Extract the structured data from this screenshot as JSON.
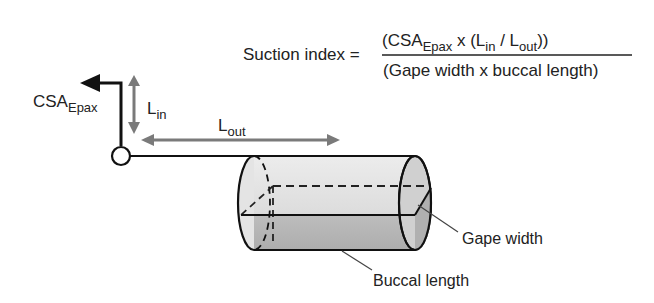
{
  "formula": {
    "lhs": "Suction index =",
    "numerator": {
      "open": "(CSA",
      "sub1": "Epax",
      "mid": " x (L",
      "sub2": "in",
      "slash": " / L",
      "sub3": "out",
      "close": "))"
    },
    "denominator": "(Gape width x buccal length)"
  },
  "labels": {
    "csa": "CSA",
    "csa_sub": "Epax",
    "lin": "L",
    "lin_sub": "in",
    "lout": "L",
    "lout_sub": "out",
    "gape_width": "Gape width",
    "buccal_length": "Buccal length"
  },
  "colors": {
    "black": "#111111",
    "gray_arrow": "#7a7a7a",
    "cyl_light": "#e2e2e2",
    "cyl_dark": "#b9b9b9"
  }
}
